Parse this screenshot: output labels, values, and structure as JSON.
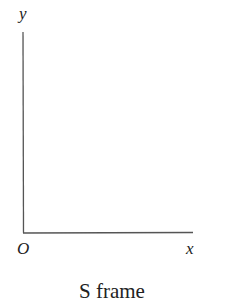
{
  "diagram": {
    "axes": {
      "y_label": "y",
      "x_label": "x",
      "origin_label": "O",
      "line_color": "#555555"
    },
    "caption": "S frame"
  }
}
